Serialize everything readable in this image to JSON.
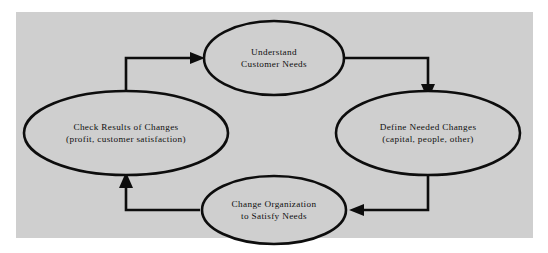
{
  "figure": {
    "background_color": "#ffffff",
    "panel_color": "#cfcfcf",
    "ink_color": "#0d0d0d"
  },
  "nodes": [
    {
      "id": "understand-customer-needs",
      "position": "top",
      "line1": "Understand",
      "line2": "Customer Needs"
    },
    {
      "id": "define-needed-changes",
      "position": "right",
      "line1": "Define Needed Changes",
      "line2": "(capital, people, other)"
    },
    {
      "id": "change-organization",
      "position": "bottom",
      "line1": "Change Organization",
      "line2": "to Satisfy Needs"
    },
    {
      "id": "check-results-of-changes",
      "position": "left",
      "line1": "Check Results of Changes",
      "line2": "(profit, customer satisfaction)"
    }
  ],
  "connectors": [
    {
      "id": "understand-to-define",
      "from": "understand-customer-needs",
      "to": "define-needed-changes",
      "direction": "down"
    },
    {
      "id": "define-to-change",
      "from": "define-needed-changes",
      "to": "change-organization",
      "direction": "left"
    },
    {
      "id": "change-to-check",
      "from": "change-organization",
      "to": "check-results-of-changes",
      "direction": "up"
    },
    {
      "id": "check-to-understand",
      "from": "check-results-of-changes",
      "to": "understand-customer-needs",
      "direction": "right"
    }
  ]
}
